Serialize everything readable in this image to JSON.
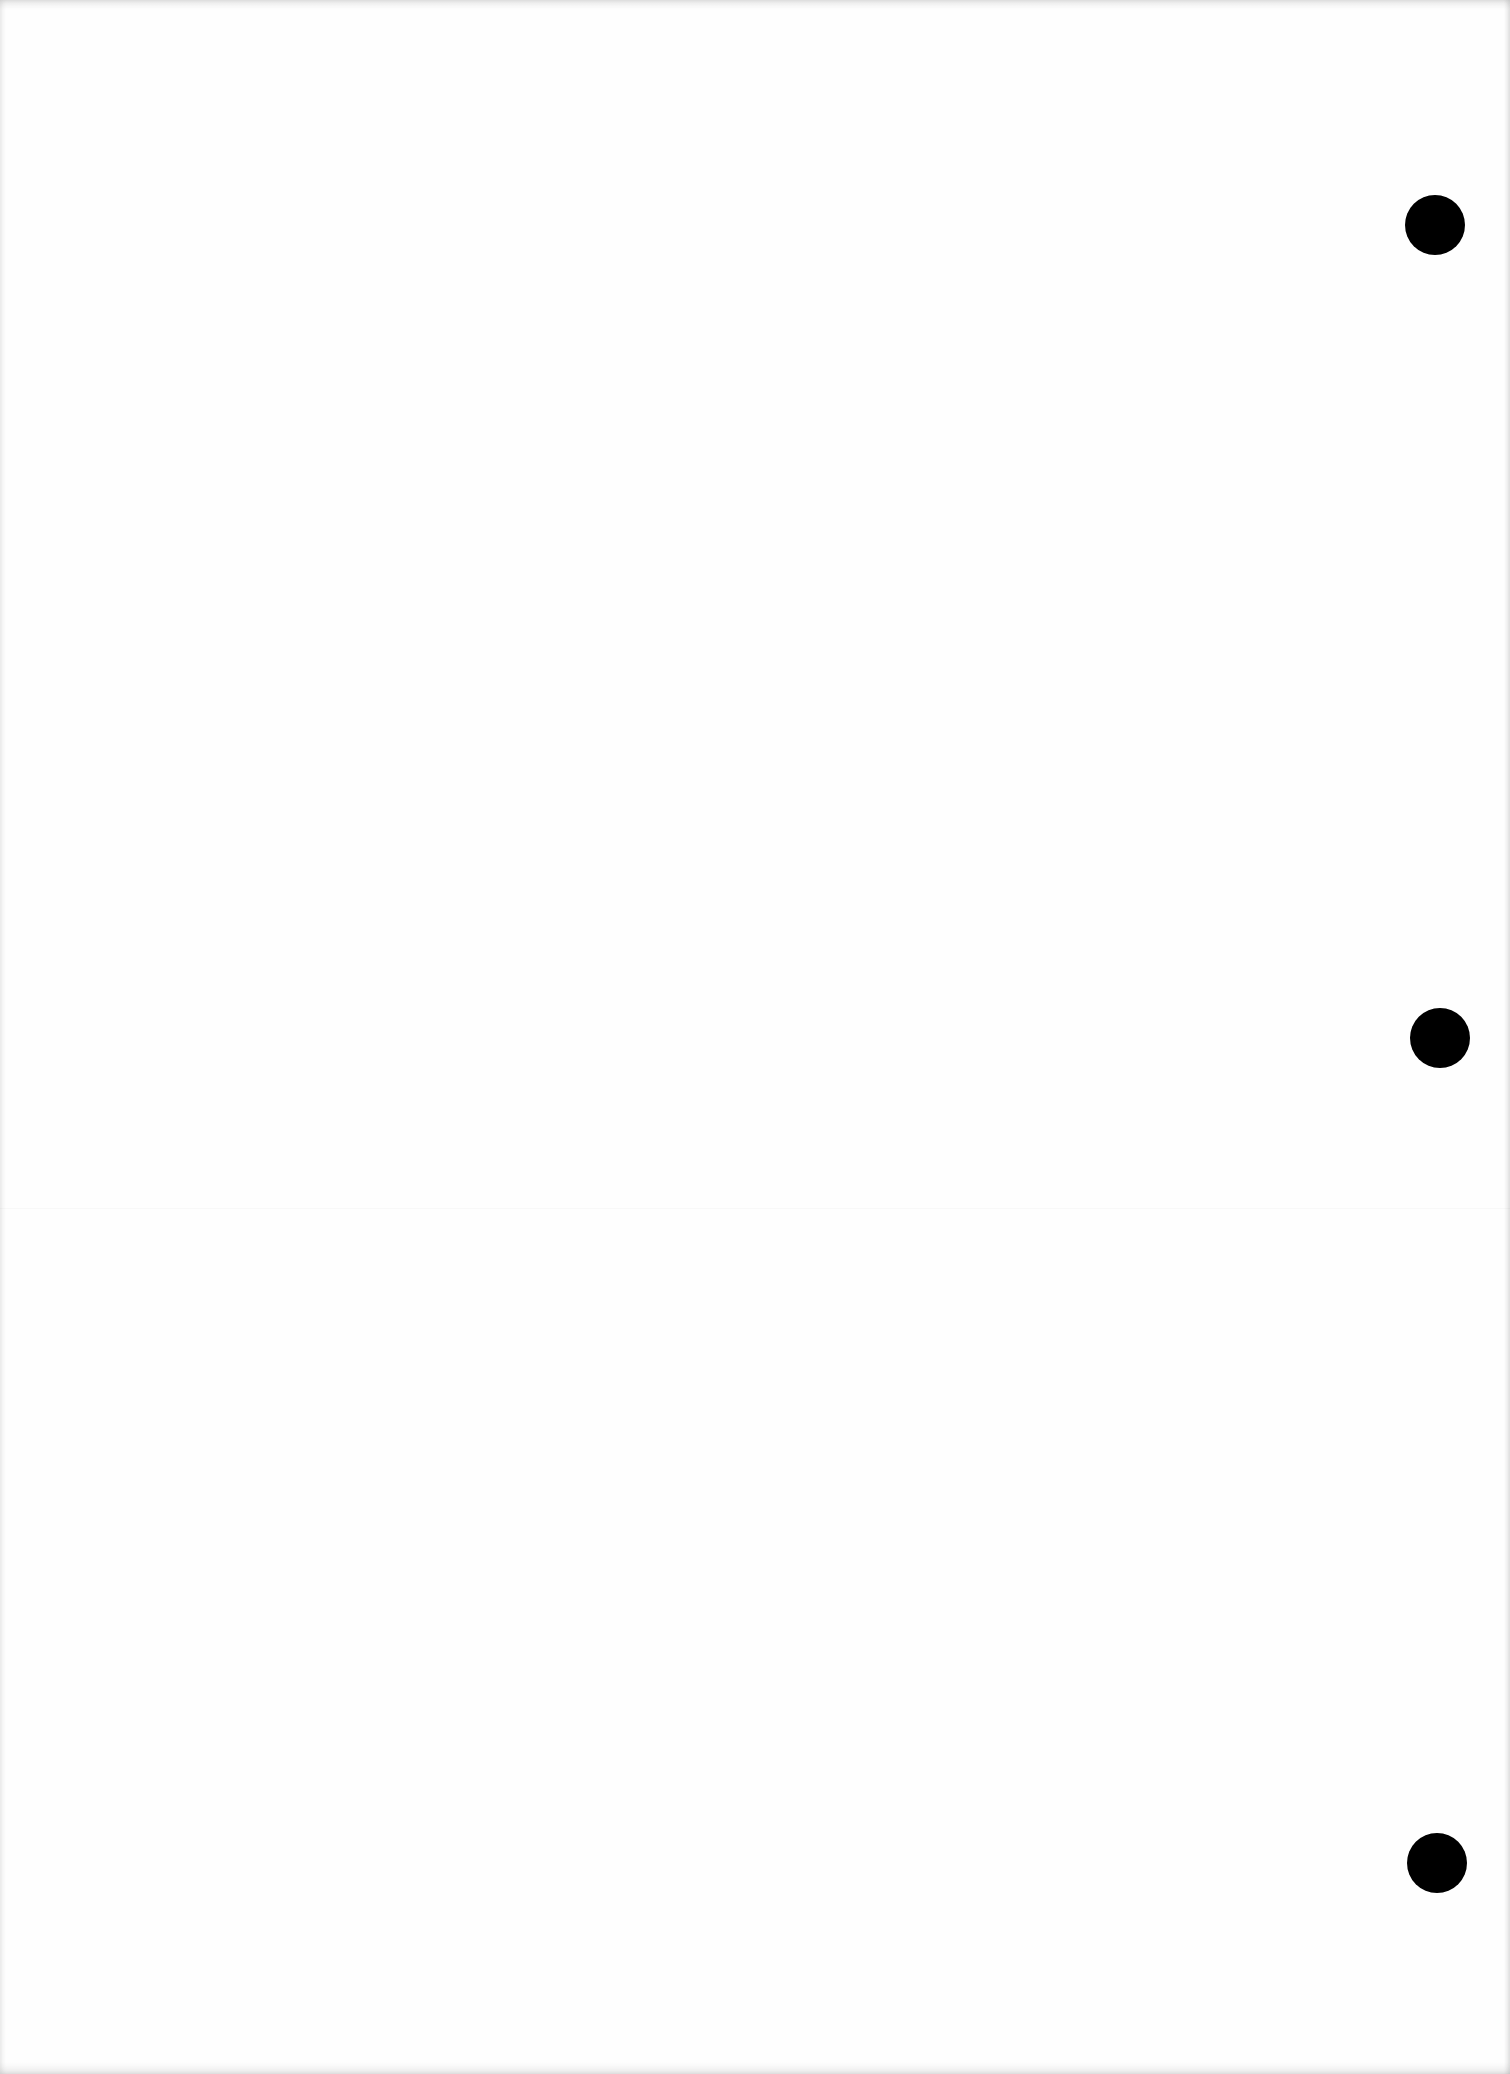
{
  "page": {
    "type": "blank-scanned-page",
    "background_color": "#ffffff",
    "punch_holes": [
      {
        "cx": 1435,
        "cy": 225,
        "r": 30,
        "color": "#000000"
      },
      {
        "cx": 1440,
        "cy": 1038,
        "r": 30,
        "color": "#000000"
      },
      {
        "cx": 1437,
        "cy": 1863,
        "r": 30,
        "color": "#000000"
      }
    ]
  }
}
